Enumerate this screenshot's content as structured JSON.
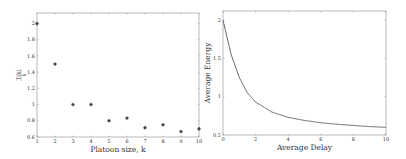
{
  "chart_data": [
    {
      "type": "scatter",
      "title": "",
      "xlabel": "Platoon size, k",
      "ylabel": "T(k)/k",
      "x": [
        1,
        2,
        3,
        4,
        5,
        6,
        7,
        8,
        9,
        10
      ],
      "values": [
        2.0,
        1.5,
        1.0,
        1.0,
        0.8,
        0.833,
        0.714,
        0.75,
        0.667,
        0.7
      ],
      "xlim": [
        1,
        10
      ],
      "ylim": [
        0.6,
        2.13
      ],
      "xticks": [
        "1",
        "2",
        "3",
        "4",
        "5",
        "6",
        "7",
        "8",
        "9",
        "10"
      ],
      "yticks": [
        "0.6",
        "0.8",
        "1",
        "1.2",
        "1.4",
        "1.6",
        "1.8",
        "2"
      ],
      "grid": false,
      "marker": "circle",
      "color": "#444444"
    },
    {
      "type": "line",
      "title": "",
      "xlabel": "Average Delay",
      "ylabel": "Average Energy",
      "x": [
        0,
        0.5,
        1,
        1.5,
        2,
        3,
        4,
        5,
        6,
        7,
        8,
        9,
        10
      ],
      "values": [
        2.0,
        1.55,
        1.25,
        1.05,
        0.93,
        0.8,
        0.73,
        0.69,
        0.66,
        0.64,
        0.625,
        0.61,
        0.6
      ],
      "xlim": [
        0,
        10
      ],
      "ylim": [
        0.5,
        2.12
      ],
      "xticks": [
        "0",
        "2",
        "4",
        "6",
        "8",
        "10"
      ],
      "yticks": [
        "0.5",
        "1",
        "1.5",
        "2"
      ],
      "grid": false,
      "color": "#666666"
    }
  ],
  "left_plot": {
    "xlabel": "Platoon size, k",
    "ylabel_num": "T(k)",
    "ylabel_den": "k"
  },
  "right_plot": {
    "xlabel": "Average Delay",
    "ylabel": "Average Energy"
  }
}
